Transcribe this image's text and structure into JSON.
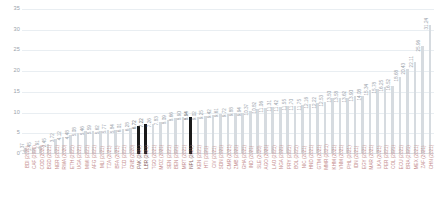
{
  "chart_data": {
    "type": "bar",
    "title": "",
    "subtitle": "",
    "xlabel": "",
    "ylabel": "",
    "ylim": [
      0,
      35
    ],
    "yticks": [
      0,
      5,
      10,
      15,
      20,
      25,
      30,
      35
    ],
    "grid": true,
    "legend": null,
    "orientation": "vertical",
    "sorted": "ascending",
    "value_label_rotation": -90,
    "category_label_rotation": -90,
    "bar_color": "#d6dbe0",
    "highlight_color": "#1a1a1a",
    "category_label_color": "#c58e8e",
    "tick_label_color": "#9aa3ab",
    "gridline_color": "#e9eef2",
    "categories": [
      "BDI (2020)",
      "CAF (2020)",
      "COD (2020)",
      "BGD (2021)",
      "NER (2021)",
      "RWA (2020)",
      "ETH (2021)",
      "UGA (2021)",
      "MWI (2021)",
      "AFG (2021)",
      "MLI (2021)",
      "TZA (2021)",
      "BFA (2021)",
      "TCD (2021)",
      "GNB (2020)",
      "PAK (2021)",
      "LBR (2021)",
      "TGO (2021)",
      "MOZ (2021)",
      "SEN (2021)",
      "BEN (2021)",
      "MRT (2021)",
      "NPL (2021)",
      "KEN (2021)",
      "HTI (2021)",
      "CIV (2021)",
      "SDN (2021)",
      "CMR (2021)",
      "ZMB (2021)",
      "GHA (2021)",
      "IND (2021)",
      "SLE (2020)",
      "AGO (2021)",
      "LAO (2021)",
      "NGA (2021)",
      "PRY (2021)",
      "BOL (2021)",
      "NIC (2021)",
      "HND (2021)",
      "GTM (2021)",
      "MMR (2021)",
      "KHM (2021)",
      "VNM (2021)",
      "PHL (2021)",
      "IDN (2021)",
      "EGY (2021)",
      "MAR (2021)",
      "LKA (2021)",
      "PER (2021)",
      "COL (2021)",
      "ECU (2021)",
      "BRA (2021)",
      "MEX (2021)",
      "ZAF (2021)",
      "CHN (2021)"
    ],
    "values": [
      1.37,
      1.45,
      1.91,
      2.45,
      3.72,
      4.12,
      4.48,
      5.08,
      5.46,
      5.59,
      5.62,
      5.77,
      5.84,
      6.01,
      6.28,
      6.72,
      7.22,
      7.26,
      7.83,
      8.09,
      8.66,
      8.9,
      8.94,
      9.02,
      9.25,
      9.42,
      9.61,
      9.72,
      9.88,
      9.94,
      10.37,
      10.82,
      11.06,
      11.31,
      11.42,
      11.55,
      11.7,
      11.75,
      12.16,
      12.22,
      12.53,
      13.5,
      13.58,
      13.62,
      13.9,
      14.08,
      15.34,
      15.78,
      16.25,
      16.52,
      18.68,
      20.43,
      22.11,
      25.96,
      31.24
    ],
    "highlighted_indices": [
      15,
      16,
      22
    ],
    "highlight_note": "three bars rendered in solid black"
  },
  "axis": {
    "y_ticks": [
      "0",
      "5",
      "10",
      "15",
      "20",
      "25",
      "30",
      "35"
    ]
  }
}
